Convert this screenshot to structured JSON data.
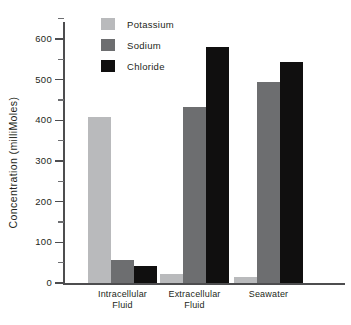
{
  "chart_data": {
    "type": "bar",
    "title": "",
    "xlabel": "",
    "ylabel": "Concentration (milliMoles)",
    "categories": [
      "Intracellular Fluid",
      "Extracellular Fluid",
      "Seawater"
    ],
    "category_lines": [
      [
        "Intracellular",
        "Fluid"
      ],
      [
        "Extracellular",
        "Fluid"
      ],
      [
        "Seawater"
      ]
    ],
    "series": [
      {
        "name": "Potassium",
        "color": "#b9babc",
        "values": [
          408,
          22,
          15
        ]
      },
      {
        "name": "Sodium",
        "color": "#6d6e70",
        "values": [
          57,
          432,
          494
        ]
      },
      {
        "name": "Chloride",
        "color": "#100f0f",
        "values": [
          42,
          580,
          543
        ]
      }
    ],
    "ylim": [
      0,
      650
    ],
    "yticks_major": [
      0,
      100,
      200,
      300,
      400,
      500,
      600
    ],
    "yticks_minor": [
      50,
      150,
      250,
      350,
      450,
      550,
      650
    ],
    "ytick_labels": [
      "0",
      "100",
      "200",
      "300",
      "400",
      "500",
      "600"
    ],
    "grid": false,
    "legend_position": "top-left-inside"
  },
  "axis": {
    "line_color": "#4d4d4f"
  }
}
